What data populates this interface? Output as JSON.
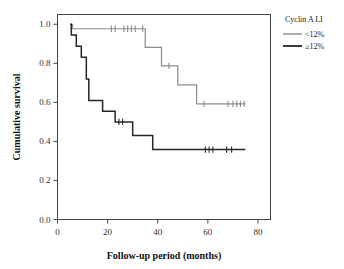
{
  "chart_data": {
    "type": "line",
    "title": "",
    "xlabel": "Follow-up period (months)",
    "ylabel": "Cumulative survival",
    "xlim": [
      0,
      85
    ],
    "ylim": [
      0.0,
      1.05
    ],
    "xticks": [
      0,
      20,
      40,
      60,
      80
    ],
    "xtick_labels": [
      "0",
      "20",
      "40",
      "60",
      "80"
    ],
    "yticks": [
      0.0,
      0.2,
      0.4,
      0.6,
      0.8,
      1.0
    ],
    "ytick_labels": [
      "0.0",
      "0.2",
      "0.4",
      "0.6",
      "0.8",
      "1.0"
    ],
    "grid": false,
    "legend_position": "right-top",
    "legend_title": "Cyclin A LI",
    "series": [
      {
        "name": "<12%",
        "color": "#8c8c8c",
        "stroke_width": 1.2,
        "steps": [
          [
            5.0,
            1.0
          ],
          [
            6.0,
            1.0
          ],
          [
            6.0,
            0.977
          ],
          [
            35.0,
            0.977
          ],
          [
            35.0,
            0.882
          ],
          [
            41.5,
            0.882
          ],
          [
            41.5,
            0.787
          ],
          [
            48.0,
            0.787
          ],
          [
            48.0,
            0.69
          ],
          [
            55.5,
            0.69
          ],
          [
            55.5,
            0.592
          ],
          [
            75.0,
            0.592
          ]
        ],
        "censor_marks": [
          [
            21.5,
            0.977
          ],
          [
            23.0,
            0.977
          ],
          [
            26.5,
            0.977
          ],
          [
            28.0,
            0.977
          ],
          [
            29.5,
            0.977
          ],
          [
            31.0,
            0.977
          ],
          [
            34.0,
            0.977
          ],
          [
            44.5,
            0.787
          ],
          [
            58.5,
            0.592
          ],
          [
            68.0,
            0.592
          ],
          [
            70.0,
            0.592
          ],
          [
            71.5,
            0.592
          ],
          [
            73.0,
            0.592
          ],
          [
            74.5,
            0.592
          ]
        ]
      },
      {
        "name": "≥12%",
        "color": "#262626",
        "stroke_width": 1.5,
        "steps": [
          [
            5.0,
            1.0
          ],
          [
            5.5,
            1.0
          ],
          [
            5.5,
            0.945
          ],
          [
            7.5,
            0.945
          ],
          [
            7.5,
            0.888
          ],
          [
            9.5,
            0.888
          ],
          [
            9.5,
            0.831
          ],
          [
            11.5,
            0.831
          ],
          [
            11.5,
            0.72
          ],
          [
            12.5,
            0.72
          ],
          [
            12.5,
            0.61
          ],
          [
            18.0,
            0.61
          ],
          [
            18.0,
            0.554
          ],
          [
            23.0,
            0.554
          ],
          [
            23.0,
            0.5
          ],
          [
            30.0,
            0.5
          ],
          [
            30.0,
            0.43
          ],
          [
            34.5,
            0.43
          ],
          [
            34.5,
            0.43
          ],
          [
            38.0,
            0.43
          ],
          [
            38.0,
            0.358
          ],
          [
            75.0,
            0.358
          ]
        ],
        "censor_marks": [
          [
            24.5,
            0.5
          ],
          [
            26.0,
            0.5
          ],
          [
            59.0,
            0.358
          ],
          [
            60.5,
            0.358
          ],
          [
            62.0,
            0.358
          ],
          [
            67.5,
            0.358
          ],
          [
            69.5,
            0.358
          ]
        ]
      }
    ]
  },
  "legend": {
    "title": "Cyclin A LI",
    "entries": [
      {
        "label": "<12%",
        "color": "#8c8c8c"
      },
      {
        "label": "≥12%",
        "color": "#262626"
      }
    ]
  },
  "axes": {
    "x_title": "Follow-up period (months)",
    "y_title": "Cumulative survival"
  }
}
